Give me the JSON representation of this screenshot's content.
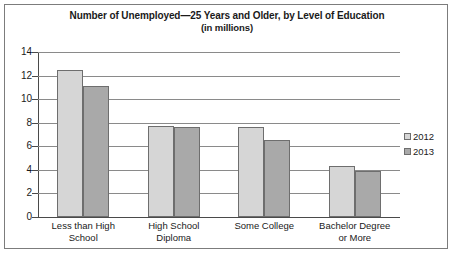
{
  "figure": {
    "border_color": "#7c7c7c",
    "background": "#ffffff"
  },
  "chart_data": {
    "type": "bar",
    "title": "Number of Unemployed—25 Years and Older, by Level of Education",
    "subtitle": "(in millions)",
    "xlabel": "",
    "ylabel": "",
    "ylim": [
      0,
      14
    ],
    "ytick_step": 2,
    "yticks": [
      14,
      12,
      10,
      8,
      6,
      4,
      2,
      0
    ],
    "grid": true,
    "legend_position": "right",
    "categories": [
      "Less than High School",
      "High School Diploma",
      "Some College",
      "Bachelor Degree or More"
    ],
    "category_lines": [
      [
        "Less than High",
        "School"
      ],
      [
        "High School",
        "Diploma"
      ],
      [
        "Some College",
        ""
      ],
      [
        "Bachelor Degree",
        "or More"
      ]
    ],
    "series": [
      {
        "name": "2012",
        "color": "#d6d6d6",
        "values": [
          12.5,
          7.7,
          7.6,
          4.3
        ]
      },
      {
        "name": "2013",
        "color": "#a9a9a9",
        "values": [
          11.1,
          7.6,
          6.5,
          3.9
        ]
      }
    ]
  },
  "legend": {
    "items": [
      {
        "label": "2012",
        "color": "#d6d6d6"
      },
      {
        "label": "2013",
        "color": "#a9a9a9"
      }
    ]
  }
}
